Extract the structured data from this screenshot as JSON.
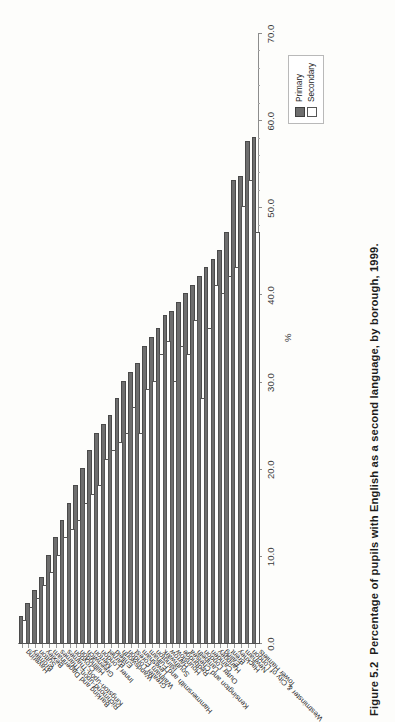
{
  "figure": {
    "number": "Figure 5.2",
    "caption": "Percentage of pupils with English as a second language, by borough, 1999."
  },
  "legend": {
    "position": "top-right",
    "items": [
      {
        "label": "Primary",
        "swatch": "filled-square",
        "color": "#6e6e6e"
      },
      {
        "label": "Secondary",
        "swatch": "outline-square",
        "color": "#ffffff"
      }
    ]
  },
  "axis": {
    "value_axis_title": "%",
    "ticks": [
      "0.0",
      "10.0",
      "20.0",
      "30.0",
      "40.0",
      "50.0",
      "60.0",
      "70.0"
    ]
  },
  "chart_data": {
    "type": "bar",
    "orientation": "horizontal",
    "title": "Percentage of pupils with English as a second language, by borough, 1999.",
    "xlabel": "%",
    "ylabel": "",
    "xlim": [
      0,
      70
    ],
    "grid": false,
    "legend_position": "top-right",
    "categories": [
      "Tower Hamlets",
      "Westminster & City of London",
      "Newham",
      "Hackney",
      "Brent",
      "Ealing",
      "Haringey",
      "Camden",
      "Outer London",
      "Lambeth",
      "Kensington and Chelsea",
      "Redbridge",
      "Hounslow",
      "Harrow",
      "Southwark",
      "Islington",
      "Hammersmith and Fulham",
      "Lewisham",
      "Waltham Forest",
      "Greater London",
      "Wandsworth",
      "Enfield",
      "Barnet",
      "Inner London",
      "Merton",
      "Greenwich",
      "Hillingdon",
      "Croydon",
      "Kingston-upon-Thames",
      "Richmond-upon-Thames",
      "Barking and Dagenham",
      "Bexley",
      "Sutton",
      "Bromley",
      "Havering"
    ],
    "series": [
      {
        "name": "Primary",
        "color": "#6e6e6e",
        "values": [
          58.0,
          57.5,
          53.5,
          53.0,
          47.0,
          45.0,
          44.0,
          43.0,
          42.0,
          41.0,
          40.0,
          39.0,
          38.0,
          37.5,
          36.0,
          35.0,
          34.0,
          32.0,
          31.0,
          30.0,
          28.0,
          26.0,
          25.0,
          24.0,
          22.0,
          20.0,
          18.0,
          16.0,
          14.0,
          12.0,
          10.0,
          7.5,
          6.0,
          4.5,
          3.0
        ]
      },
      {
        "name": "Secondary",
        "color": "#ffffff",
        "values": [
          47.0,
          53.0,
          50.0,
          43.0,
          42.0,
          40.0,
          41.0,
          36.0,
          28.0,
          37.0,
          33.0,
          34.0,
          30.0,
          34.5,
          33.0,
          30.0,
          29.0,
          24.0,
          27.0,
          24.0,
          23.0,
          22.0,
          21.0,
          18.0,
          17.0,
          16.0,
          14.0,
          13.0,
          12.0,
          10.0,
          8.0,
          6.5,
          5.0,
          4.0,
          2.5
        ]
      }
    ]
  }
}
